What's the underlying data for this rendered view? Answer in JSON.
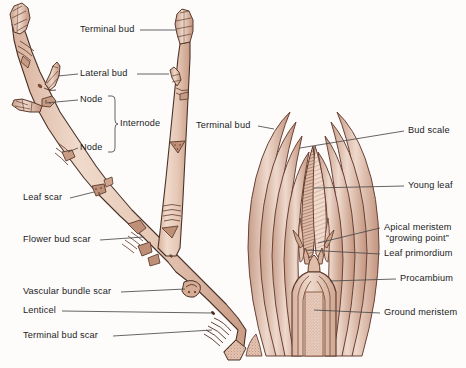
{
  "figure": {
    "background_color": "#fdfcfb",
    "ink_color": "#1b1b1b",
    "twig_fill_color": "#e8cdbd",
    "twig_shade_color": "#d2a892",
    "scale_outline_color": "#6b4236",
    "leader_color": "#4a4a4a",
    "width": 466,
    "height": 368
  },
  "left_diagram": {
    "name": "woody twig",
    "labels": [
      {
        "id": "terminal-bud",
        "text": "Terminal bud",
        "x": 80,
        "y": 30,
        "align": "left",
        "leader": {
          "x1": 140,
          "y1": 30,
          "x2": 176,
          "y2": 30
        }
      },
      {
        "id": "lateral-bud",
        "text": "Lateral bud",
        "x": 80,
        "y": 74,
        "align": "left",
        "leader": {
          "x1": 137,
          "y1": 74,
          "x2": 51,
          "y2": 77
        }
      },
      {
        "id": "node-upper",
        "text": "Node",
        "x": 80,
        "y": 100,
        "align": "left",
        "leader": {
          "x1": 78,
          "y1": 100,
          "x2": 45,
          "y2": 103
        }
      },
      {
        "id": "internode",
        "text": "Internode",
        "x": 118,
        "y": 124,
        "align": "left",
        "leader": null
      },
      {
        "id": "node-lower",
        "text": "Node",
        "x": 80,
        "y": 148,
        "align": "left",
        "leader": {
          "x1": 78,
          "y1": 148,
          "x2": 62,
          "y2": 150
        }
      },
      {
        "id": "leaf-scar",
        "text": "Leaf scar",
        "x": 23,
        "y": 198,
        "align": "left",
        "leader": {
          "x1": 70,
          "y1": 198,
          "x2": 96,
          "y2": 194
        }
      },
      {
        "id": "flower-bud-scar",
        "text": "Flower bud scar",
        "x": 23,
        "y": 240,
        "align": "left",
        "leader": {
          "x1": 100,
          "y1": 240,
          "x2": 144,
          "y2": 238
        }
      },
      {
        "id": "vascular-bundle-scar",
        "text": "Vascular bundle scar",
        "x": 23,
        "y": 292,
        "align": "left",
        "leader": {
          "x1": 121,
          "y1": 292,
          "x2": 188,
          "y2": 290
        }
      },
      {
        "id": "lenticel",
        "text": "Lenticel",
        "x": 23,
        "y": 311,
        "align": "left",
        "leader": {
          "x1": 62,
          "y1": 311,
          "x2": 212,
          "y2": 313
        }
      },
      {
        "id": "terminal-bud-scar",
        "text": "Terminal bud scar",
        "x": 23,
        "y": 336,
        "align": "left",
        "leader": {
          "x1": 113,
          "y1": 336,
          "x2": 216,
          "y2": 330
        }
      }
    ],
    "bracket": {
      "id": "internode-bracket",
      "top": 96,
      "bottom": 152,
      "x": 108,
      "tip_x": 114,
      "tip_y": 124
    }
  },
  "right_diagram": {
    "name": "terminal bud longitudinal section",
    "labels": [
      {
        "id": "terminal-bud-section",
        "text": "Terminal bud",
        "x": 196,
        "y": 126,
        "align": "left",
        "leader": {
          "x1": 258,
          "y1": 126,
          "x2": 272,
          "y2": 129
        }
      },
      {
        "id": "bud-scale",
        "text": "Bud scale",
        "x": 408,
        "y": 131,
        "align": "left",
        "leader": {
          "x1": 404,
          "y1": 131,
          "x2": 299,
          "y2": 148
        }
      },
      {
        "id": "young-leaf",
        "text": "Young leaf",
        "x": 408,
        "y": 186,
        "align": "left",
        "leader": {
          "x1": 404,
          "y1": 186,
          "x2": 312,
          "y2": 186
        }
      },
      {
        "id": "apical-meristem",
        "text": "Apical meristem",
        "x": 384,
        "y": 228,
        "align": "left",
        "leader": {
          "x1": 380,
          "y1": 228,
          "x2": 315,
          "y2": 238
        }
      },
      {
        "id": "growing-point",
        "text": "“growing point”",
        "x": 386,
        "y": 239,
        "align": "left",
        "leader": null
      },
      {
        "id": "leaf-primordium",
        "text": "Leaf primordium",
        "x": 384,
        "y": 254,
        "align": "left",
        "leader": {
          "x1": 380,
          "y1": 254,
          "x2": 303,
          "y2": 247
        }
      },
      {
        "id": "procambium",
        "text": "Procambium",
        "x": 400,
        "y": 279,
        "align": "left",
        "leader": {
          "x1": 396,
          "y1": 279,
          "x2": 318,
          "y2": 279
        }
      },
      {
        "id": "ground-meristem",
        "text": "Ground meristem",
        "x": 384,
        "y": 313,
        "align": "left",
        "leader": {
          "x1": 380,
          "y1": 313,
          "x2": 300,
          "y2": 307
        }
      }
    ]
  }
}
